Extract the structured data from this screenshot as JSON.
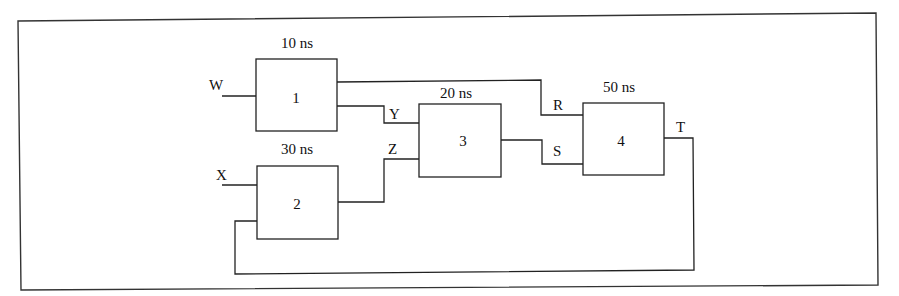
{
  "diagram": {
    "blocks": [
      {
        "id": "1",
        "label": "1",
        "delay": "10 ns"
      },
      {
        "id": "2",
        "label": "2",
        "delay": "30 ns"
      },
      {
        "id": "3",
        "label": "3",
        "delay": "20 ns"
      },
      {
        "id": "4",
        "label": "4",
        "delay": "50 ns"
      }
    ],
    "signals": {
      "W": "W",
      "X": "X",
      "Y": "Y",
      "Z": "Z",
      "R": "R",
      "S": "S",
      "T": "T"
    },
    "connections": [
      {
        "from": "W",
        "to": "1"
      },
      {
        "from": "X",
        "to": "2"
      },
      {
        "from": "1",
        "to": "3",
        "signal": "Y"
      },
      {
        "from": "2",
        "to": "3",
        "signal": "Z"
      },
      {
        "from": "1",
        "to": "4",
        "signal": "R"
      },
      {
        "from": "3",
        "to": "4",
        "signal": "S"
      },
      {
        "from": "4",
        "to": "2",
        "signal": "T"
      }
    ]
  }
}
